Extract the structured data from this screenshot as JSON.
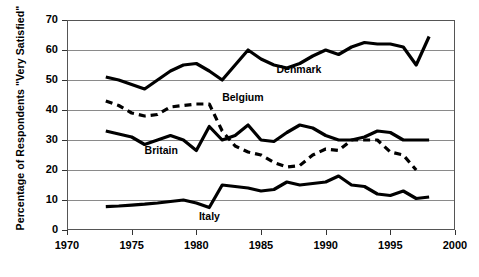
{
  "chart_data": {
    "type": "line",
    "title": "",
    "xlabel": "",
    "ylabel": "Percentage of Respondents \"Very Satisfied\"",
    "xlim": [
      1970,
      2000
    ],
    "ylim": [
      0,
      70
    ],
    "grid": true,
    "legend_position": "inline-labels",
    "yticks": [
      0,
      10,
      20,
      30,
      40,
      50,
      60,
      70
    ],
    "xticks": [
      1970,
      1975,
      1980,
      1985,
      1990,
      1995,
      2000
    ],
    "series": [
      {
        "name": "Denmark",
        "style": "solid",
        "color": "#000000",
        "label_x": 1986.2,
        "label_y": 53.5,
        "x": [
          1973,
          1974,
          1975,
          1976,
          1977,
          1978,
          1979,
          1980,
          1981,
          1982,
          1983,
          1984,
          1985,
          1986,
          1987,
          1988,
          1989,
          1990,
          1991,
          1992,
          1993,
          1994,
          1995,
          1996,
          1997,
          1998
        ],
        "values": [
          51,
          50,
          48.5,
          47,
          50,
          53,
          55,
          55.5,
          53,
          50,
          55,
          60,
          57,
          55,
          54,
          55.5,
          58,
          60,
          58.5,
          61,
          62.5,
          62,
          62,
          61,
          55,
          64.5
        ]
      },
      {
        "name": "Belgium",
        "style": "dashed",
        "color": "#000000",
        "label_x": 1982.0,
        "label_y": 44.0,
        "x": [
          1973,
          1974,
          1975,
          1976,
          1977,
          1978,
          1979,
          1980,
          1981,
          1982,
          1983,
          1984,
          1985,
          1986,
          1987,
          1988,
          1989,
          1990,
          1991,
          1992,
          1993,
          1994,
          1995,
          1996,
          1997
        ],
        "values": [
          43,
          41.5,
          39,
          38,
          38.5,
          41,
          41.5,
          42,
          42,
          33,
          28,
          26,
          25,
          22.5,
          21,
          21.5,
          25,
          27,
          26.5,
          30,
          30,
          30,
          26,
          25,
          20
        ]
      },
      {
        "name": "Britain",
        "style": "solid",
        "color": "#000000",
        "label_x": 1976.0,
        "label_y": 26.5,
        "x": [
          1973,
          1974,
          1975,
          1976,
          1977,
          1978,
          1979,
          1980,
          1981,
          1982,
          1983,
          1984,
          1985,
          1986,
          1987,
          1988,
          1989,
          1990,
          1991,
          1992,
          1993,
          1994,
          1995,
          1996,
          1997,
          1998
        ],
        "values": [
          33,
          32,
          31,
          28.5,
          30,
          31.5,
          30,
          26.5,
          34.5,
          30,
          31.5,
          35,
          30,
          29.5,
          32.5,
          35,
          34,
          31.5,
          30,
          30,
          31,
          33,
          32.5,
          30,
          30,
          30
        ]
      },
      {
        "name": "Italy",
        "style": "solid",
        "color": "#000000",
        "label_x": 1980.2,
        "label_y": 4.2,
        "x": [
          1973,
          1974,
          1975,
          1976,
          1977,
          1978,
          1979,
          1980,
          1981,
          1982,
          1983,
          1984,
          1985,
          1986,
          1987,
          1988,
          1989,
          1990,
          1991,
          1992,
          1993,
          1994,
          1995,
          1996,
          1997,
          1998
        ],
        "values": [
          7.8,
          8,
          8.3,
          8.6,
          9,
          9.5,
          10,
          9,
          7.5,
          15,
          14.5,
          14,
          13,
          13.5,
          16,
          15,
          15.5,
          16,
          18,
          15,
          14.5,
          12,
          11.5,
          13,
          10.5,
          11
        ]
      }
    ]
  }
}
